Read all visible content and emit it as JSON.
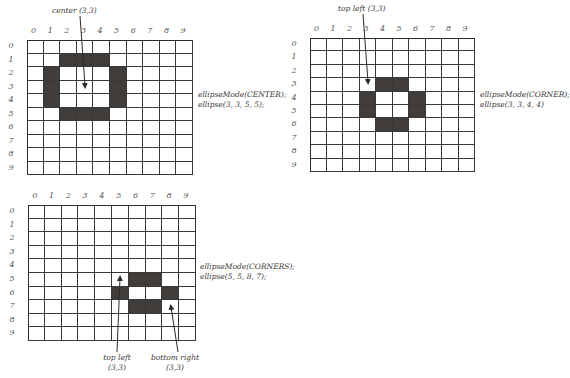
{
  "diagrams": [
    {
      "id": "center",
      "col_labels": [
        "0",
        "1",
        "2",
        "3",
        "4",
        "5",
        "6",
        "7",
        "8",
        "9"
      ],
      "row_labels": [
        "0",
        "1",
        "2",
        "3",
        "4",
        "5",
        "6",
        "7",
        "8",
        "9"
      ],
      "filled_cells": [
        [
          2,
          1
        ],
        [
          3,
          1
        ],
        [
          4,
          1
        ],
        [
          1,
          2
        ],
        [
          5,
          2
        ],
        [
          1,
          3
        ],
        [
          5,
          3
        ],
        [
          1,
          4
        ],
        [
          5,
          4
        ],
        [
          2,
          5
        ],
        [
          3,
          5
        ],
        [
          4,
          5
        ]
      ],
      "code": [
        "ellipseMode(CENTER);",
        "ellipse(3, 3, 5, 5);"
      ],
      "annotations": [
        {
          "text": "center (3,3)",
          "target_cell": [
            3,
            3
          ]
        }
      ]
    },
    {
      "id": "corner",
      "col_labels": [
        "0",
        "1",
        "2",
        "3",
        "4",
        "5",
        "6",
        "7",
        "8",
        "9"
      ],
      "row_labels": [
        "0",
        "1",
        "2",
        "3",
        "4",
        "5",
        "6",
        "7",
        "8",
        "9"
      ],
      "filled_cells": [
        [
          4,
          3
        ],
        [
          5,
          3
        ],
        [
          3,
          4
        ],
        [
          6,
          4
        ],
        [
          3,
          5
        ],
        [
          6,
          5
        ],
        [
          4,
          6
        ],
        [
          5,
          6
        ]
      ],
      "code": [
        "ellipseMode(CORNER);",
        "ellipse(3, 3, 4, 4)"
      ],
      "annotations": [
        {
          "text": "top left (3,3)",
          "target_cell": [
            3,
            3
          ]
        }
      ]
    },
    {
      "id": "corners",
      "col_labels": [
        "0",
        "1",
        "2",
        "3",
        "4",
        "5",
        "6",
        "7",
        "8",
        "9"
      ],
      "row_labels": [
        "0",
        "1",
        "2",
        "3",
        "4",
        "5",
        "6",
        "7",
        "8",
        "9"
      ],
      "filled_cells": [
        [
          6,
          5
        ],
        [
          7,
          5
        ],
        [
          5,
          6
        ],
        [
          8,
          6
        ],
        [
          6,
          7
        ],
        [
          7,
          7
        ]
      ],
      "code": [
        "ellipseMode(CORNERS);",
        "ellipse(5, 5, 8, 7);"
      ],
      "annotations": [
        {
          "text": "top left",
          "text2": "(3,3)",
          "target_cell": [
            5,
            5
          ]
        },
        {
          "text": "bottom right",
          "text2": "(3,3)",
          "target_cell": [
            8,
            7
          ]
        }
      ]
    }
  ],
  "colors": {
    "fill": "#403d3a",
    "line": "#3a3836"
  }
}
